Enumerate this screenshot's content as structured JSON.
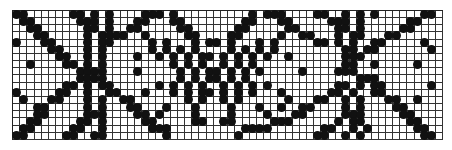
{
  "chart": {
    "title": "",
    "columns": 60,
    "rows": 18,
    "symbol": "filled-dot",
    "dot_color": "#111111",
    "grid_color": "#333333",
    "pattern": [
      "XX......XX.X.X....XXX.X..........X.XXX....XX..X.X.X......XX",
      ".XX......XXX.X...XX...XX........XX...XX.....XXX.X......XX..",
      "..XX......XX.X..XX.....XX......XX.....XX.....XX.X.....XX...",
      "...XX.....X.XXXX..X.....XX....XX.....X..XX...X.XX...XX.....",
      "X...XX....X.XX.....X.X...X.XX.X...X.X.....XX.X.X..XX.....X.",
      ".....XX...X.X......X.X.X.X....X.X.X.X.........XX.XX.......X",
      "......XX..X.X....X..X.X.X.XX.X.X.X.X..X.......XXX..........",
      "..X....XX.X.X.........X.X.X..X.X.X............XX..X.....X..",
      ".........XXXX....X.....X.X.XX.X.X.X.....X....XXX...........",
      ".........XXXX..........X.X.XX.X.X...............XXX........",
      ".......XX.X.XX......X.X.X.X..X.X.X.X.........XX.X.XX......X",
      "X.....XX..X..XX...X...X.X.XX.X.X.X...X......XX.X..XX.......",
      ".X...XX...X.X..XX.......X.X..X.X......X...XX..X.X...XX..X..",
      "...XX.....X.X...XX...X...X....X...X..X..XX....X.X....XX....",
      "...XX.....XXX....XX.X....X....X....X...XX.....XXX.....XX...",
      "..XX.....XX.X.....XX.....XX..XX.....XXX......X.XX......XX..",
      ".XX.....XX..X......XXX..........XXXX.......XX..X.X......XX.",
      "XX.....XX..XX........X.........X..........XX..X.X........XX"
    ]
  }
}
